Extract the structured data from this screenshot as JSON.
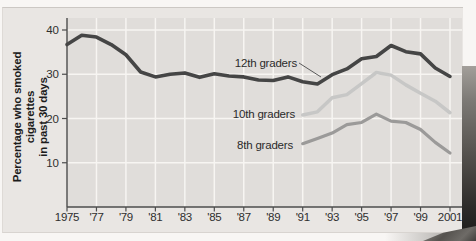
{
  "colors": {
    "page_bg": "#f8f6f4",
    "panel_bg": "#e9e6e3",
    "plot_bg": "#e0ddda",
    "gridline": "#f7f5f2",
    "axis": "#4c4c4c",
    "tick_text": "#2e2e2e",
    "leader_line": "#5a5a5a",
    "series_12th": "#454545",
    "series_10th": "#c7c7c6",
    "series_8th": "#9b9a99"
  },
  "chart_data": {
    "type": "line",
    "title": "",
    "ylabel_line1": "Percentage who smoked cigarettes",
    "ylabel_line2": "in past 30 days",
    "xlabel": "",
    "xlim": [
      1975,
      2001.8
    ],
    "ylim": [
      0,
      42.7
    ],
    "grid": true,
    "x_tick_years": [
      1975,
      1977,
      1979,
      1981,
      1983,
      1985,
      1987,
      1989,
      1991,
      1993,
      1995,
      1997,
      1999,
      2001
    ],
    "x_tick_labels": [
      "1975",
      "'77",
      "'79",
      "'81",
      "'83",
      "'85",
      "'87",
      "'89",
      "'91",
      "'93",
      "'95",
      "'97",
      "'99",
      "2001"
    ],
    "y_ticks": [
      10,
      20,
      30,
      40
    ],
    "series": [
      {
        "name": "12th graders",
        "start_year": 1975,
        "values": [
          36.7,
          38.8,
          38.4,
          36.7,
          34.4,
          30.5,
          29.4,
          30.0,
          30.3,
          29.3,
          30.1,
          29.6,
          29.4,
          28.7,
          28.6,
          29.4,
          28.3,
          27.8,
          29.9,
          31.2,
          33.5,
          34.0,
          36.5,
          35.1,
          34.6,
          31.4,
          29.5
        ],
        "color_key": "series_12th",
        "stroke_width": 3.6
      },
      {
        "name": "10th graders",
        "start_year": 1991,
        "values": [
          20.8,
          21.5,
          24.7,
          25.4,
          27.9,
          30.4,
          29.8,
          27.6,
          25.7,
          23.9,
          21.3
        ],
        "color_key": "series_10th",
        "stroke_width": 3.5
      },
      {
        "name": "8th graders",
        "start_year": 1991,
        "values": [
          14.3,
          15.5,
          16.7,
          18.6,
          19.1,
          21.0,
          19.4,
          19.1,
          17.5,
          14.6,
          12.2
        ],
        "color_key": "series_8th",
        "stroke_width": 3.2
      }
    ],
    "legend_position": "inline-labels-left-of-lines"
  }
}
